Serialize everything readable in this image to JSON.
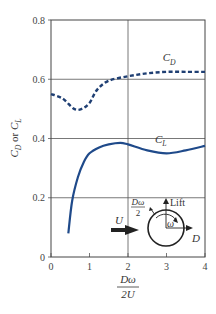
{
  "chart_data": {
    "type": "line",
    "title": "",
    "xlabel": "Dω / 2U",
    "xlabel_numerator": "Dω",
    "xlabel_denominator": "2U",
    "ylabel": "C_D or C_L",
    "xlim": [
      0,
      4
    ],
    "ylim": [
      0,
      0.8
    ],
    "xticks": [
      "0",
      "1",
      "2",
      "3",
      "4"
    ],
    "yticks": [
      "0",
      "0.2",
      "0.4",
      "0.6",
      "0.8"
    ],
    "grid": true,
    "series": [
      {
        "name": "C_D",
        "style": "dashed",
        "color": "#1f3f73",
        "x": [
          0,
          0.3,
          0.6,
          0.8,
          1.0,
          1.2,
          1.5,
          2.0,
          2.5,
          3.0,
          3.5,
          4.0
        ],
        "y": [
          0.55,
          0.535,
          0.5,
          0.5,
          0.52,
          0.565,
          0.595,
          0.61,
          0.62,
          0.625,
          0.625,
          0.625
        ]
      },
      {
        "name": "C_L",
        "style": "solid",
        "color": "#1f4a8a",
        "x": [
          0.45,
          0.55,
          0.7,
          0.85,
          1.0,
          1.25,
          1.5,
          1.8,
          2.0,
          2.5,
          3.0,
          3.5,
          4.0
        ],
        "y": [
          0.08,
          0.19,
          0.27,
          0.32,
          0.35,
          0.37,
          0.38,
          0.385,
          0.38,
          0.36,
          0.35,
          0.36,
          0.375
        ]
      }
    ],
    "annotations": [
      {
        "text": "C_D",
        "x": 2.9,
        "y": 0.66
      },
      {
        "text": "C_L",
        "x": 2.7,
        "y": 0.385
      }
    ],
    "inset": {
      "freestream_label": "U",
      "surface_speed_label": "Dω / 2",
      "rotation_label": "ω",
      "lift_label": "Lift",
      "drag_label": "D"
    }
  }
}
